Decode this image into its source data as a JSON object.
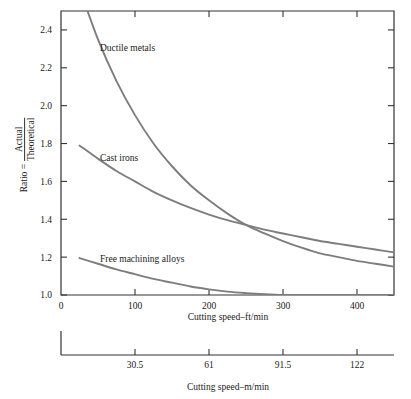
{
  "chart_data": {
    "type": "line",
    "title": "",
    "xlabel": "Cutting speed–ft/min",
    "xlabel_secondary": "Cutting speed–m/min",
    "ylabel_prefix": "Ratio =",
    "ylabel_numerator": "Actual",
    "ylabel_denominator": "Theoretical",
    "xlim": [
      0,
      450
    ],
    "ylim": [
      1.0,
      2.5
    ],
    "grid": false,
    "legend": "inline-annotations",
    "xticks": [
      0,
      100,
      200,
      300,
      400
    ],
    "xtick_labels": [
      "0",
      "100",
      "200",
      "300",
      "400"
    ],
    "xticks_secondary_ftmin": [
      100,
      200,
      300,
      400
    ],
    "xtick_labels_secondary": [
      "30.5",
      "61",
      "91.5",
      "122"
    ],
    "yticks": [
      1.0,
      1.2,
      1.4,
      1.6,
      1.8,
      2.0,
      2.2,
      2.4
    ],
    "ytick_labels": [
      "1.0",
      "1.2",
      "1.4",
      "1.6",
      "1.8",
      "2.0",
      "2.2",
      "2.4"
    ],
    "curve_color": "#7d7d7d",
    "axis_color": "#333333",
    "series": [
      {
        "name": "Ductile metals",
        "label": "Ductile metals",
        "x": [
          25,
          50,
          75,
          100,
          125,
          150,
          175,
          200,
          225,
          250,
          275,
          300,
          325,
          350,
          375,
          400,
          425,
          450
        ],
        "y": [
          2.62,
          2.35,
          2.13,
          1.95,
          1.8,
          1.68,
          1.58,
          1.5,
          1.43,
          1.37,
          1.325,
          1.285,
          1.25,
          1.22,
          1.2,
          1.18,
          1.165,
          1.15
        ]
      },
      {
        "name": "Cast irons",
        "label": "Cast irons",
        "x": [
          25,
          50,
          75,
          100,
          125,
          150,
          175,
          200,
          225,
          250,
          275,
          300,
          325,
          350,
          375,
          400,
          425,
          450
        ],
        "y": [
          1.79,
          1.72,
          1.655,
          1.6,
          1.545,
          1.5,
          1.46,
          1.425,
          1.395,
          1.37,
          1.345,
          1.325,
          1.305,
          1.285,
          1.27,
          1.255,
          1.24,
          1.225
        ]
      },
      {
        "name": "Free machining alloys",
        "label": "Free machining alloys",
        "x": [
          25,
          50,
          75,
          100,
          125,
          150,
          175,
          200,
          225,
          250,
          275,
          300,
          325,
          350,
          375,
          400,
          425,
          450
        ],
        "y": [
          1.195,
          1.165,
          1.135,
          1.11,
          1.085,
          1.065,
          1.045,
          1.03,
          1.018,
          1.01,
          1.004,
          1.0,
          1.0,
          1.0,
          1.0,
          1.0,
          1.0,
          1.0
        ]
      }
    ]
  },
  "labels": {
    "ductile_metals": "Ductile metals",
    "cast_irons": "Cast irons",
    "free_machining_alloys": "Free machining alloys"
  }
}
